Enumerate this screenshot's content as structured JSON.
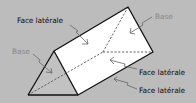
{
  "diagram": {
    "colors": {
      "background": "#bcbcbc",
      "lateral_face": "#ffffff",
      "base_face": "#c2c2c2",
      "edge": "#111111",
      "hidden_edge": "#555555",
      "base_label": "#8a8a8a",
      "face_label": "#111111"
    },
    "labels": {
      "face_top": "Face latérale",
      "base_right": "Base",
      "base_left": "Base",
      "face_middle": "Face latérale",
      "face_bottom": "Face latérale"
    }
  }
}
